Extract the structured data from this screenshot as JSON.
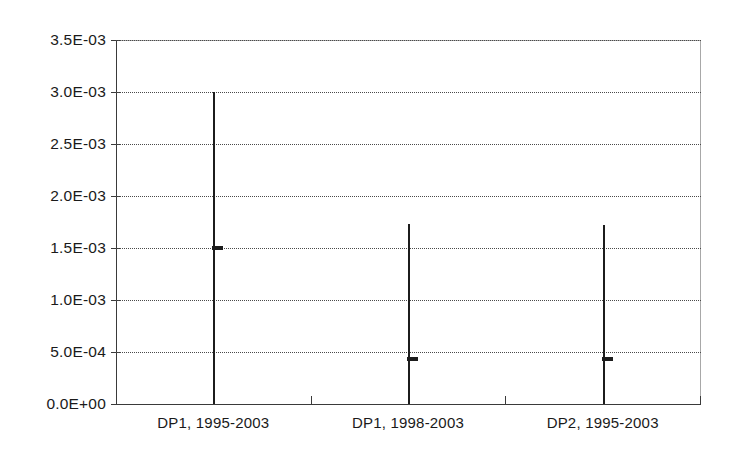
{
  "chart_data": {
    "type": "bar",
    "title": "",
    "subtitle": "",
    "xlabel": "",
    "ylabel": "",
    "categories": [
      "DP1, 1995-2003",
      "DP1, 1998-2003",
      "DP2, 1995-2003"
    ],
    "series": [
      {
        "name": "range-high",
        "values": [
          0.003,
          0.00173,
          0.00172
        ]
      },
      {
        "name": "marker",
        "values": [
          0.0015,
          0.00043,
          0.00043
        ]
      },
      {
        "name": "range-low",
        "values": [
          0.0,
          0.0,
          0.0
        ]
      }
    ],
    "ylim": [
      0,
      0.0035
    ],
    "ytick_values": [
      0.0,
      0.0005,
      0.001,
      0.0015,
      0.002,
      0.0025,
      0.003,
      0.0035
    ],
    "ytick_labels": [
      "0.0E+00",
      "5.0E-04",
      "1.0E-03",
      "1.5E-03",
      "2.0E-03",
      "2.5E-03",
      "3.0E-03",
      "3.5E-03"
    ],
    "grid": true,
    "grid_axis": "y",
    "grid_style": "dotted",
    "legend": false,
    "legend_position": "none",
    "annotations": [],
    "colors": {
      "background": "#ffffff",
      "axis": "#3a3a3a",
      "grid": "#4a4a4a",
      "data": "#1c1c1c",
      "text": "#1a1a1a"
    }
  }
}
